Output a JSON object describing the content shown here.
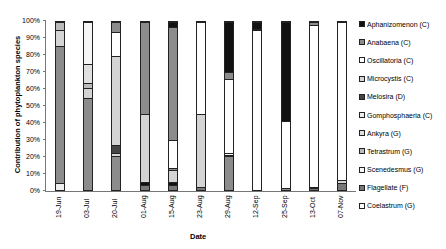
{
  "chart_data": {
    "type": "bar",
    "stacked": true,
    "normalized_percent": true,
    "title": "",
    "xlabel": "Date",
    "ylabel": "Contribution of phytoplankton species",
    "ylim": [
      0,
      100
    ],
    "yticks": [
      "0%",
      "10%",
      "20%",
      "30%",
      "40%",
      "50%",
      "60%",
      "70%",
      "80%",
      "90%",
      "100%"
    ],
    "categories": [
      "19-Jun",
      "03-Jul",
      "20-Jul",
      "01-Aug",
      "15-Aug",
      "23-Aug",
      "29-Aug",
      "12-Sep",
      "25-Sep",
      "13-Oct",
      "07-Nov"
    ],
    "legend_position": "right",
    "legend": [
      {
        "name": "Aphanizomenon (C)",
        "color": "#111111"
      },
      {
        "name": "Anabaena (C)",
        "color": "#8c8c8c"
      },
      {
        "name": "Oscillatoria (C)",
        "color": "#ffffff"
      },
      {
        "name": "Microcystis (C)",
        "color": "#d4d4d4"
      },
      {
        "name": "Melosira (D)",
        "color": "#444444"
      },
      {
        "name": "Gomphosphaeria (C)",
        "color": "#eeeeee"
      },
      {
        "name": "Ankyra (G)",
        "color": "#e0e0e0"
      },
      {
        "name": "Tetrastrum (G)",
        "color": "#bbbbbb"
      },
      {
        "name": "Scenedesmus (G)",
        "color": "#f6f6f6"
      },
      {
        "name": "Flagellate (F)",
        "color": "#777777"
      },
      {
        "name": "Coelastrum (G)",
        "color": "#ffffff"
      }
    ],
    "bars": [
      {
        "date": "19-Jun",
        "segments": [
          {
            "s": "Gomphosphaeria (C)",
            "v": 4
          },
          {
            "s": "Anabaena (C)",
            "v": 82
          },
          {
            "s": "Microcystis (C)",
            "v": 9
          },
          {
            "s": "Tetrastrum (G)",
            "v": 5
          }
        ]
      },
      {
        "date": "03-Jul",
        "segments": [
          {
            "s": "Anabaena (C)",
            "v": 55
          },
          {
            "s": "Microcystis (C)",
            "v": 6
          },
          {
            "s": "Tetrastrum (G)",
            "v": 3
          },
          {
            "s": "Ankyra (G)",
            "v": 11
          },
          {
            "s": "Scenedesmus (G)",
            "v": 25
          }
        ]
      },
      {
        "date": "20-Jul",
        "segments": [
          {
            "s": "Anabaena (C)",
            "v": 20
          },
          {
            "s": "Microcystis (C)",
            "v": 2
          },
          {
            "s": "Melosira (D)",
            "v": 5
          },
          {
            "s": "Microcystis (C)",
            "v": 53
          },
          {
            "s": "Oscillatoria (C)",
            "v": 14
          },
          {
            "s": "Anabaena (C)",
            "v": 6
          }
        ]
      },
      {
        "date": "01-Aug",
        "segments": [
          {
            "s": "Flagellate (F)",
            "v": 3
          },
          {
            "s": "Aphanizomenon (C)",
            "v": 2
          },
          {
            "s": "Microcystis (C)",
            "v": 40
          },
          {
            "s": "Anabaena (C)",
            "v": 55
          }
        ]
      },
      {
        "date": "15-Aug",
        "segments": [
          {
            "s": "Flagellate (F)",
            "v": 3
          },
          {
            "s": "Aphanizomenon (C)",
            "v": 2
          },
          {
            "s": "Microcystis (C)",
            "v": 7
          },
          {
            "s": "Anabaena (C)",
            "v": 1
          },
          {
            "s": "Oscillatoria (C)",
            "v": 17
          },
          {
            "s": "Anabaena (C)",
            "v": 67
          },
          {
            "s": "Aphanizomenon (C)",
            "v": 3
          }
        ]
      },
      {
        "date": "23-Aug",
        "segments": [
          {
            "s": "Flagellate (F)",
            "v": 2
          },
          {
            "s": "Microcystis (C)",
            "v": 43
          },
          {
            "s": "Oscillatoria (C)",
            "v": 55
          }
        ]
      },
      {
        "date": "29-Aug",
        "segments": [
          {
            "s": "Anabaena (C)",
            "v": 20
          },
          {
            "s": "Melosira (D)",
            "v": 1
          },
          {
            "s": "Scenedesmus (G)",
            "v": 1
          },
          {
            "s": "Oscillatoria (C)",
            "v": 44
          },
          {
            "s": "Anabaena (C)",
            "v": 4
          },
          {
            "s": "Aphanizomenon (C)",
            "v": 30
          }
        ]
      },
      {
        "date": "12-Sep",
        "segments": [
          {
            "s": "Oscillatoria (C)",
            "v": 95
          },
          {
            "s": "Anabaena (C)",
            "v": 1
          },
          {
            "s": "Aphanizomenon (C)",
            "v": 4
          }
        ]
      },
      {
        "date": "25-Sep",
        "segments": [
          {
            "s": "Anabaena (C)",
            "v": 1
          },
          {
            "s": "Oscillatoria (C)",
            "v": 40
          },
          {
            "s": "Aphanizomenon (C)",
            "v": 59
          }
        ]
      },
      {
        "date": "13-Oct",
        "segments": [
          {
            "s": "Flagellate (F)",
            "v": 1
          },
          {
            "s": "Microcystis (C)",
            "v": 1
          },
          {
            "s": "Oscillatoria (C)",
            "v": 96
          },
          {
            "s": "Anabaena (C)",
            "v": 2
          }
        ]
      },
      {
        "date": "07-Nov",
        "segments": [
          {
            "s": "Flagellate (F)",
            "v": 4
          },
          {
            "s": "Microcystis (C)",
            "v": 2
          },
          {
            "s": "Oscillatoria (C)",
            "v": 94
          }
        ]
      }
    ]
  }
}
